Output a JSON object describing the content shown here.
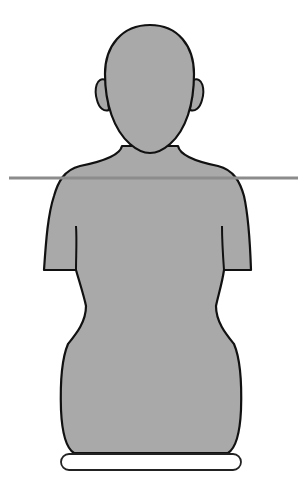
{
  "figure": {
    "colors": {
      "background": "#ffffff",
      "body_fill": "#a9a9a9",
      "outline": "#111111",
      "reference_line": "#8c8c8c",
      "base_fill": "#ffffff"
    },
    "reference_line": {
      "y": 178,
      "x1": 9,
      "x2": 298
    }
  }
}
